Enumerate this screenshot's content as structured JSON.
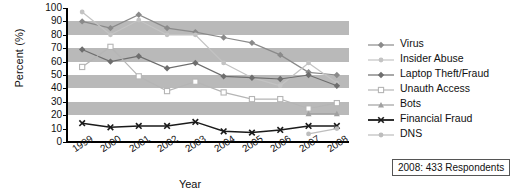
{
  "chart_data": {
    "type": "line",
    "title": "",
    "xlabel": "Year",
    "ylabel": "Percent (%)",
    "x": [
      1999,
      2000,
      2001,
      2002,
      2003,
      2004,
      2005,
      2006,
      2007,
      2008
    ],
    "xticklabels": [
      "1999",
      "2000",
      "2001",
      "2002",
      "2003",
      "2004",
      "2005",
      "2006",
      "2007",
      "2008"
    ],
    "yticklabels": [
      "0",
      "10",
      "20",
      "30",
      "40",
      "50",
      "60",
      "70",
      "80",
      "90",
      "100"
    ],
    "ylim": [
      0,
      100
    ],
    "ytick_step": 10,
    "grid": "horizontal alternating gray bands at 20-30, 40-50, 60-70, 80-90",
    "legend_position": "right",
    "annotation": "2008: 433 Respondents",
    "series": [
      {
        "name": "Virus",
        "color": "#8a8a8a",
        "marker": "diamond",
        "values": [
          90,
          85,
          95,
          85,
          82,
          78,
          74,
          65,
          52,
          50
        ]
      },
      {
        "name": "Insider Abuse",
        "color": "#c3c3c3",
        "marker": "circle",
        "values": [
          97,
          80,
          91,
          80,
          80,
          59,
          48,
          42,
          59,
          44
        ]
      },
      {
        "name": "Laptop Theft/Fraud",
        "color": "#6e6e6e",
        "marker": "diamond",
        "values": [
          69,
          60,
          64,
          55,
          59,
          49,
          48,
          47,
          50,
          42
        ]
      },
      {
        "name": "Unauth Access",
        "color": "#b5b5b5",
        "marker": "square-open",
        "values": [
          56,
          71,
          49,
          38,
          45,
          37,
          32,
          32,
          25,
          29
        ]
      },
      {
        "name": "Bots",
        "color": "#a0a0a0",
        "marker": "triangle",
        "values": [
          null,
          null,
          null,
          null,
          null,
          null,
          null,
          null,
          21,
          21
        ]
      },
      {
        "name": "Financial Fraud",
        "color": "#1a1a1a",
        "marker": "x",
        "values": [
          14,
          11,
          12,
          12,
          15,
          8,
          7,
          9,
          12,
          12
        ]
      },
      {
        "name": "DNS",
        "color": "#bdbdbd",
        "marker": "dot",
        "values": [
          null,
          null,
          null,
          null,
          null,
          null,
          null,
          null,
          6,
          10
        ]
      }
    ]
  },
  "legend": {
    "items": [
      {
        "label": "Virus"
      },
      {
        "label": "Insider Abuse"
      },
      {
        "label": "Laptop Theft/Fraud"
      },
      {
        "label": "Unauth Access"
      },
      {
        "label": "Bots"
      },
      {
        "label": "Financial Fraud"
      },
      {
        "label": "DNS"
      }
    ]
  },
  "note": {
    "text": "2008: 433 Respondents"
  }
}
